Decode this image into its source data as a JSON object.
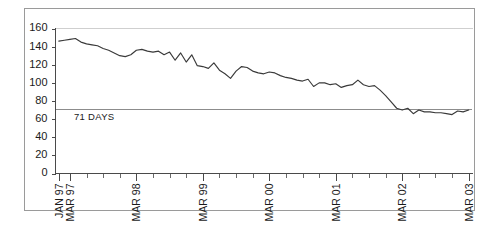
{
  "chart_data": {
    "type": "line",
    "title": "",
    "subtitle": "",
    "xlabel": "",
    "ylabel": "",
    "ylim": [
      0,
      160
    ],
    "ytick_labels": [
      "0",
      "20",
      "40",
      "60",
      "80",
      "100",
      "120",
      "140",
      "160"
    ],
    "ytick_values": [
      0,
      20,
      40,
      60,
      80,
      100,
      120,
      140,
      160
    ],
    "grid": false,
    "legend": "none",
    "xtick_labels": [
      "JAN 97",
      "MAR 97",
      "MAR 98",
      "MAR 99",
      "MAR 00",
      "MAR 01",
      "MAR 02",
      "MAR 03"
    ],
    "xtick_positions": [
      0,
      2,
      14,
      26,
      38,
      50,
      62,
      74
    ],
    "annotations": [
      {
        "name": "reference-line-label",
        "text": "71 DAYS",
        "value": 71,
        "style": "horizontal-reference-line"
      }
    ],
    "series": [
      {
        "name": "days",
        "x": [
          "JAN 97",
          "FEB 97",
          "MAR 97",
          "APR 97",
          "MAY 97",
          "JUN 97",
          "JUL 97",
          "AUG 97",
          "SEP 97",
          "OCT 97",
          "NOV 97",
          "DEC 97",
          "JAN 98",
          "FEB 98",
          "MAR 98",
          "APR 98",
          "MAY 98",
          "JUN 98",
          "JUL 98",
          "AUG 98",
          "SEP 98",
          "OCT 98",
          "NOV 98",
          "DEC 98",
          "JAN 99",
          "FEB 99",
          "MAR 99",
          "APR 99",
          "MAY 99",
          "JUN 99",
          "JUL 99",
          "AUG 99",
          "SEP 99",
          "OCT 99",
          "NOV 99",
          "DEC 99",
          "JAN 00",
          "FEB 00",
          "MAR 00",
          "APR 00",
          "MAY 00",
          "JUN 00",
          "JUL 00",
          "AUG 00",
          "SEP 00",
          "OCT 00",
          "NOV 00",
          "DEC 00",
          "JAN 01",
          "FEB 01",
          "MAR 01",
          "APR 01",
          "MAY 01",
          "JUN 01",
          "JUL 01",
          "AUG 01",
          "SEP 01",
          "OCT 01",
          "NOV 01",
          "DEC 01",
          "JAN 02",
          "FEB 02",
          "MAR 02",
          "APR 02",
          "MAY 02",
          "JUN 02",
          "JUL 02",
          "AUG 02",
          "SEP 02",
          "OCT 02",
          "NOV 02",
          "DEC 02",
          "JAN 03",
          "FEB 03",
          "MAR 03"
        ],
        "values": [
          146,
          147,
          148,
          149,
          145,
          143,
          142,
          141,
          138,
          136,
          133,
          130,
          129,
          131,
          136,
          137,
          135,
          134,
          135,
          131,
          134,
          125,
          133,
          123,
          131,
          119,
          118,
          116,
          122,
          114,
          110,
          105,
          113,
          118,
          117,
          113,
          111,
          110,
          112,
          111,
          108,
          106,
          105,
          103,
          102,
          104,
          96,
          100,
          100,
          98,
          99,
          95,
          97,
          98,
          103,
          98,
          96,
          97,
          92,
          86,
          79,
          72,
          70,
          72,
          66,
          70,
          68,
          68,
          67,
          67,
          66,
          65,
          69,
          68,
          70
        ]
      }
    ]
  },
  "figure": {
    "reference_label": "71 DAYS"
  }
}
